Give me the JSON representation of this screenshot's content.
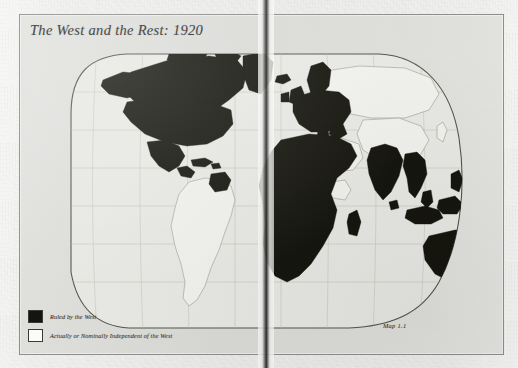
{
  "plate": {
    "title": "The West and the Rest: 1920",
    "caption": "Map 1.1"
  },
  "legend": {
    "items": [
      {
        "swatch": "dark",
        "label": "Ruled by the West",
        "color": "#15150f"
      },
      {
        "swatch": "light",
        "label": "Actually or Nominally Independent of the West",
        "color": "#fbfbf8"
      }
    ]
  },
  "colors": {
    "paper": "#dcdcd9",
    "ruled_fill": "#15150f",
    "independent_fill": "#eeeeea",
    "outline": "#55554f",
    "graticule": "#b9b9b3",
    "frame": "#8e8e8c"
  },
  "map_data": {
    "type": "world-choropleth",
    "projection": "oval / Mollweide-like global outline spanning a two-page book spread",
    "year": 1920,
    "classification": [
      "Ruled by the West",
      "Actually or Nominally Independent of the West"
    ],
    "regions_ruled_by_the_west": [
      "Canada",
      "United States",
      "Alaska",
      "Greenland",
      "Mexico",
      "Central America",
      "Caribbean islands",
      "The Guianas",
      "All of Europe",
      "British Isles",
      "Scandinavia",
      "Iberia",
      "Italy",
      "Balkans",
      "North Africa",
      "West Africa",
      "Central Africa",
      "East Africa",
      "Southern Africa",
      "Madagascar",
      "India",
      "Ceylon",
      "Burma",
      "Indochina",
      "Siam frontier zones",
      "Malaya",
      "Dutch East Indies",
      "Philippines",
      "New Guinea",
      "Australia",
      "New Zealand",
      "Pacific island groups"
    ],
    "regions_independent": [
      "South America (Brazil, Argentina, Chile, Peru, Bolivia, Colombia, Venezuela, Paraguay, Uruguay, Ecuador)",
      "Russia / Soviet Union",
      "China",
      "Mongolia",
      "Tibet",
      "Japan",
      "Korea",
      "Persia",
      "Afghanistan",
      "Arabia",
      "Turkey",
      "Ethiopia",
      "Liberia",
      "Siam"
    ],
    "graticule": true,
    "legend_position": "bottom-left",
    "caption_position": "bottom-right"
  }
}
